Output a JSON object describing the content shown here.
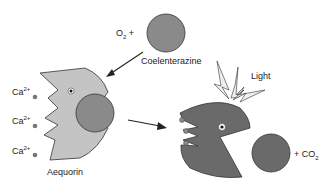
{
  "labels": {
    "o2_plus": "O",
    "o2_sub": "2",
    "o2_suffix": " +",
    "coelenterazine": "Coelenterazine",
    "light": "Light",
    "ca": "Ca",
    "ca_sup": "2+",
    "aequorin": "Aequorin",
    "co2_prefix": "+ CO",
    "co2_sub": "2"
  },
  "colors": {
    "aequorin_light": "#c4c4c4",
    "aequorin_dark": "#6a6a6a",
    "substrate": "#8a8a8a",
    "outline": "#333333"
  }
}
